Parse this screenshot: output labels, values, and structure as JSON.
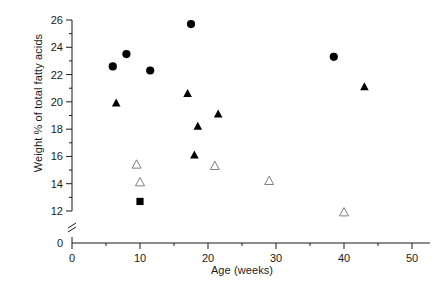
{
  "chart_data": {
    "type": "scatter",
    "title": "",
    "xlabel": "Age (weeks)",
    "ylabel": "Weight % of total fatty acids",
    "xlim": [
      0,
      50
    ],
    "ylim": [
      12,
      26
    ],
    "y_axis_break": true,
    "y_baseline_label": "0",
    "grid": false,
    "legend": "none",
    "xticks": [
      0,
      10,
      20,
      30,
      40,
      50
    ],
    "xtick_labels": [
      "0",
      "10",
      "20",
      "30",
      "40",
      "50"
    ],
    "xminor_ticks": [
      5,
      15,
      25,
      35,
      45
    ],
    "yticks": [
      12,
      14,
      16,
      18,
      20,
      22,
      24,
      26
    ],
    "ytick_labels": [
      "12",
      "14",
      "16",
      "18",
      "20",
      "22",
      "24",
      "26"
    ],
    "yminor_ticks": [
      13,
      15,
      17,
      19,
      21,
      23,
      25
    ],
    "series": [
      {
        "name": "filled-circle",
        "marker": "filled-circle",
        "color": "#000000",
        "points": [
          {
            "x": 6.0,
            "y": 22.6
          },
          {
            "x": 8.0,
            "y": 23.5
          },
          {
            "x": 11.5,
            "y": 22.3
          },
          {
            "x": 17.5,
            "y": 25.7
          },
          {
            "x": 38.5,
            "y": 23.3
          }
        ]
      },
      {
        "name": "filled-triangle",
        "marker": "filled-triangle",
        "color": "#000000",
        "points": [
          {
            "x": 6.5,
            "y": 19.9
          },
          {
            "x": 17.0,
            "y": 20.6
          },
          {
            "x": 18.0,
            "y": 16.1
          },
          {
            "x": 18.5,
            "y": 18.2
          },
          {
            "x": 21.5,
            "y": 19.1
          },
          {
            "x": 43.0,
            "y": 21.1
          }
        ]
      },
      {
        "name": "open-triangle",
        "marker": "open-triangle",
        "color": "#808080",
        "points": [
          {
            "x": 9.5,
            "y": 15.4
          },
          {
            "x": 10.0,
            "y": 14.1
          },
          {
            "x": 21.0,
            "y": 15.3
          },
          {
            "x": 29.0,
            "y": 14.2
          },
          {
            "x": 40.0,
            "y": 11.9
          }
        ]
      },
      {
        "name": "filled-square",
        "marker": "filled-square",
        "color": "#000000",
        "points": [
          {
            "x": 10.0,
            "y": 12.7
          }
        ]
      }
    ]
  }
}
